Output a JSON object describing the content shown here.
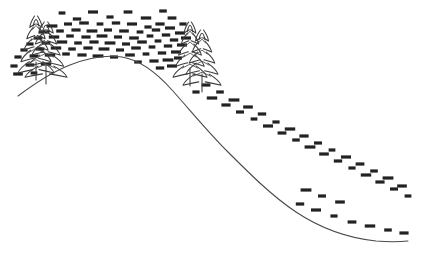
{
  "artwork": {
    "title": "Hillside with conifers and snow dashes",
    "medium": "line drawing",
    "background_color": "#ffffff",
    "line_color": "#4a4a4a",
    "tree_line_color": "#3b3b3b",
    "dash_color": "#222222",
    "canvas": {
      "width": 440,
      "height": 268
    }
  },
  "hill": {
    "name": "hill-ridge-curve",
    "path": "M 18,96 C 34,84 52,72 70,65 C 90,57 108,55 122,57 C 140,60 156,72 172,90 C 190,110 208,132 228,152 C 250,174 272,196 296,212 C 320,228 348,238 376,241 C 388,242 399,242 408,241",
    "description": "single continuous ridge curve rising from lower-left, cresting near x=122, descending steeply to a flat tail at lower-right"
  },
  "trees": [
    {
      "name": "tree-left-back",
      "apex_x": 36,
      "apex_y": 16,
      "base_y": 78,
      "half_width": 18,
      "tiers": 5,
      "trunk": "M 36,62 L 36,80"
    },
    {
      "name": "tree-left-front",
      "apex_x": 46,
      "apex_y": 22,
      "base_y": 82,
      "half_width": 21,
      "tiers": 5,
      "trunk": "M 46,66 L 46,84"
    },
    {
      "name": "tree-right-back",
      "apex_x": 190,
      "apex_y": 22,
      "base_y": 82,
      "half_width": 17,
      "tiers": 5,
      "trunk": "M 190,68 L 190,86"
    },
    {
      "name": "tree-right-front",
      "apex_x": 202,
      "apex_y": 30,
      "base_y": 90,
      "half_width": 19,
      "tiers": 5,
      "trunk": "M 202,74 L 202,92"
    }
  ],
  "dashes": {
    "description": "short horizontal dark dashes scattered above and along the ridge, representing blowing snow; dense over the crest, sparse on the lower-right tail",
    "width": 9,
    "height": 3.2,
    "count": 118,
    "points": [
      [
        62,
        13
      ],
      [
        77,
        19
      ],
      [
        93,
        12
      ],
      [
        110,
        17
      ],
      [
        128,
        12
      ],
      [
        146,
        18
      ],
      [
        163,
        11
      ],
      [
        160,
        24
      ],
      [
        52,
        26
      ],
      [
        68,
        24
      ],
      [
        84,
        23
      ],
      [
        100,
        24
      ],
      [
        116,
        23
      ],
      [
        132,
        24
      ],
      [
        148,
        27
      ],
      [
        172,
        18
      ],
      [
        44,
        32
      ],
      [
        60,
        31
      ],
      [
        76,
        30
      ],
      [
        92,
        31
      ],
      [
        108,
        30
      ],
      [
        124,
        31
      ],
      [
        140,
        32
      ],
      [
        156,
        30
      ],
      [
        170,
        28
      ],
      [
        183,
        24
      ],
      [
        38,
        38
      ],
      [
        54,
        37
      ],
      [
        70,
        36
      ],
      [
        86,
        37
      ],
      [
        102,
        36
      ],
      [
        118,
        37
      ],
      [
        134,
        38
      ],
      [
        150,
        36
      ],
      [
        166,
        35
      ],
      [
        180,
        33
      ],
      [
        30,
        44
      ],
      [
        46,
        43
      ],
      [
        62,
        42
      ],
      [
        78,
        43
      ],
      [
        94,
        42
      ],
      [
        110,
        43
      ],
      [
        126,
        44
      ],
      [
        142,
        42
      ],
      [
        158,
        41
      ],
      [
        174,
        40
      ],
      [
        186,
        38
      ],
      [
        24,
        50
      ],
      [
        40,
        49
      ],
      [
        56,
        48
      ],
      [
        72,
        49
      ],
      [
        88,
        48
      ],
      [
        104,
        49
      ],
      [
        120,
        50
      ],
      [
        136,
        48
      ],
      [
        152,
        47
      ],
      [
        168,
        46
      ],
      [
        182,
        45
      ],
      [
        18,
        57
      ],
      [
        34,
        56
      ],
      [
        50,
        55
      ],
      [
        66,
        54
      ],
      [
        82,
        55
      ],
      [
        98,
        56
      ],
      [
        114,
        57
      ],
      [
        130,
        55
      ],
      [
        146,
        54
      ],
      [
        162,
        53
      ],
      [
        176,
        52
      ],
      [
        14,
        66
      ],
      [
        30,
        65
      ],
      [
        46,
        64
      ],
      [
        138,
        62
      ],
      [
        154,
        61
      ],
      [
        168,
        60
      ],
      [
        178,
        58
      ],
      [
        18,
        74
      ],
      [
        34,
        73
      ],
      [
        160,
        68
      ],
      [
        172,
        66
      ],
      [
        196,
        92
      ],
      [
        206,
        85
      ],
      [
        212,
        98
      ],
      [
        220,
        92
      ],
      [
        226,
        105
      ],
      [
        234,
        100
      ],
      [
        240,
        112
      ],
      [
        248,
        107
      ],
      [
        254,
        119
      ],
      [
        262,
        114
      ],
      [
        268,
        126
      ],
      [
        276,
        122
      ],
      [
        282,
        133
      ],
      [
        290,
        129
      ],
      [
        296,
        140
      ],
      [
        304,
        136
      ],
      [
        310,
        147
      ],
      [
        318,
        143
      ],
      [
        324,
        154
      ],
      [
        332,
        150
      ],
      [
        338,
        161
      ],
      [
        346,
        157
      ],
      [
        352,
        168
      ],
      [
        360,
        164
      ],
      [
        366,
        175
      ],
      [
        374,
        171
      ],
      [
        380,
        182
      ],
      [
        388,
        178
      ],
      [
        394,
        189
      ],
      [
        402,
        186
      ],
      [
        408,
        196
      ],
      [
        300,
        204
      ],
      [
        316,
        210
      ],
      [
        334,
        216
      ],
      [
        352,
        222
      ],
      [
        370,
        226
      ],
      [
        388,
        230
      ],
      [
        404,
        233
      ],
      [
        306,
        190
      ],
      [
        322,
        196
      ],
      [
        340,
        202
      ]
    ]
  }
}
